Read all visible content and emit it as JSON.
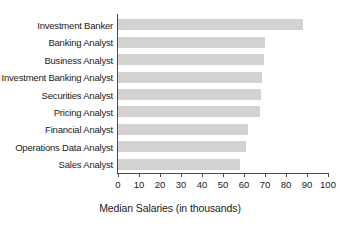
{
  "chart_data": {
    "type": "bar",
    "orientation": "horizontal",
    "title": "",
    "xlabel": "Median Salaries (in thousands)",
    "ylabel": "",
    "xlim": [
      0,
      100
    ],
    "xticks": [
      0,
      10,
      20,
      30,
      40,
      50,
      60,
      70,
      80,
      90,
      100
    ],
    "grid": false,
    "legend": false,
    "bar_color": "#d2d2d2",
    "axis_color": "#4a4a4a",
    "categories": [
      "Investment Banker",
      "Banking Analyst",
      "Business Analyst",
      "Investment Banking Analyst",
      "Securities Analyst",
      "Pricing Analyst",
      "Financial Analyst",
      "Operations Data Analyst",
      "Sales Analyst"
    ],
    "values": [
      88,
      70,
      69.5,
      68.5,
      68,
      67.5,
      62,
      61,
      58
    ]
  }
}
